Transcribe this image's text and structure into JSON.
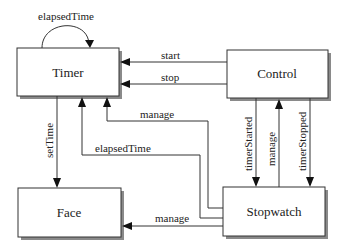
{
  "diagram": {
    "nodes": {
      "timer": {
        "label": "Timer"
      },
      "control": {
        "label": "Control"
      },
      "face": {
        "label": "Face"
      },
      "stopwatch": {
        "label": "Stopwatch"
      }
    },
    "edges": {
      "timer_self": {
        "label": "elapsedTime",
        "from": "Timer",
        "to": "Timer"
      },
      "start": {
        "label": "start",
        "from": "Control",
        "to": "Timer"
      },
      "stop": {
        "label": "stop",
        "from": "Control",
        "to": "Timer"
      },
      "setTime": {
        "label": "setTime",
        "from": "Timer",
        "to": "Face"
      },
      "manage_timer": {
        "label": "manage",
        "from": "Stopwatch",
        "to": "Timer"
      },
      "elapsedTime_sw": {
        "label": "elapsedTime",
        "from": "Stopwatch",
        "to": "Timer"
      },
      "timerStarted": {
        "label": "timerStarted",
        "from": "Control",
        "to": "Stopwatch"
      },
      "manage_control": {
        "label": "manage",
        "from": "Stopwatch",
        "to": "Control"
      },
      "timerStopped": {
        "label": "timerStopped",
        "from": "Control",
        "to": "Stopwatch"
      },
      "manage_face": {
        "label": "manage",
        "from": "Stopwatch",
        "to": "Face"
      }
    }
  }
}
